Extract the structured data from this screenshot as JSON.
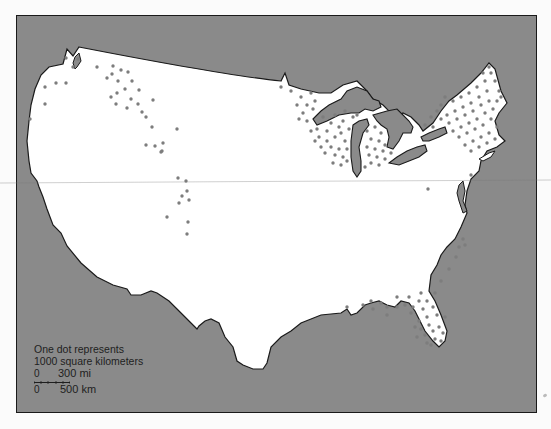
{
  "map": {
    "title": "Distribution map of the contiguous United States",
    "colors": {
      "water": "#8a8a8a",
      "land": "#ffffff",
      "outline": "#1a1a1a",
      "dot": "#7d7d7d"
    },
    "regions_with_dots": [
      "Northeast / New England",
      "Upper Midwest (Wisconsin, Michigan, Minnesota)",
      "Florida & Gulf Coast",
      "Southeast Atlantic coast",
      "Northern Rockies / Idaho",
      "Interior Northwest"
    ]
  },
  "legend": {
    "line1": "One dot represents",
    "line2": "1000 square kilometers"
  },
  "scale": {
    "mi_zero": "0",
    "mi_label": "300 mi",
    "km_zero": "0",
    "km_label": "500 km"
  }
}
